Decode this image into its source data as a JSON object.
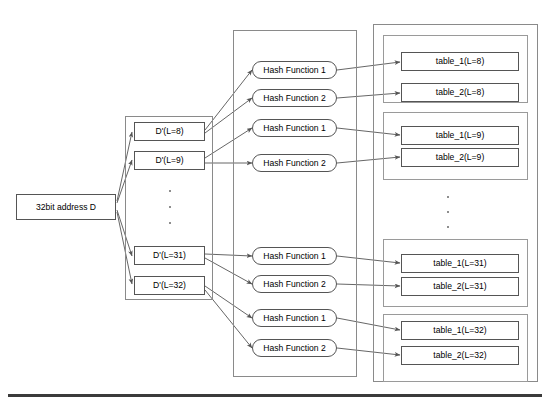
{
  "diagram": {
    "title_visible": false,
    "input": {
      "label": "32bit address D"
    },
    "derived_column": {
      "items": [
        {
          "label": "D'(L=8)"
        },
        {
          "label": "D'(L=9)"
        },
        {
          "label": "D'(L=31)"
        },
        {
          "label": "D'(L=32)"
        }
      ],
      "ellipsis": "three-dots"
    },
    "hash_column": {
      "groups": [
        {
          "functions": [
            {
              "label": "Hash Function 1"
            },
            {
              "label": "Hash Function 2"
            }
          ]
        },
        {
          "functions": [
            {
              "label": "Hash Function 1"
            },
            {
              "label": "Hash Function 2"
            }
          ]
        },
        {
          "functions": [
            {
              "label": "Hash Function 1"
            },
            {
              "label": "Hash Function 2"
            }
          ]
        },
        {
          "functions": [
            {
              "label": "Hash Function 1"
            },
            {
              "label": "Hash Function 2"
            }
          ]
        }
      ]
    },
    "table_column": {
      "groups": [
        {
          "tables": [
            {
              "label": "table_1(L=8)"
            },
            {
              "label": "table_2(L=8)"
            }
          ]
        },
        {
          "tables": [
            {
              "label": "table_1(L=9)"
            },
            {
              "label": "table_2(L=9)"
            }
          ]
        },
        {
          "tables": [
            {
              "label": "table_1(L=31)"
            },
            {
              "label": "table_2(L=31)"
            }
          ]
        },
        {
          "tables": [
            {
              "label": "table_1(L=32)"
            },
            {
              "label": "table_2(L=32)"
            }
          ]
        }
      ],
      "ellipsis": "three-dots"
    },
    "colors": {
      "frame_stroke": "#8a8a8a",
      "box_stroke": "#555555",
      "arrow_stroke": "#555555",
      "baseline": "#3b3b3b",
      "background": "#ffffff"
    }
  }
}
